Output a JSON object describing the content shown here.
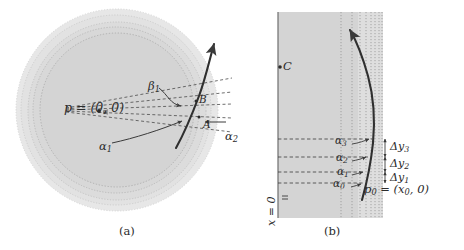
{
  "figure": {
    "panel_a": {
      "caption": "(a)",
      "center_point_label": "p = (0, 0)",
      "point_a_label": "A",
      "point_b_label": "B",
      "alpha1_label": "α",
      "alpha1_sub": "1",
      "alpha2_label": "α",
      "alpha2_sub": "2",
      "beta1_label": "β",
      "beta1_sub": "1"
    },
    "panel_b": {
      "caption": "(b)",
      "point_c_label": "C",
      "axis_label": "x = 0",
      "p0_label": "p",
      "p0_sub": "0",
      "p0_value": " = (x",
      "p0_value_sub": "0",
      "p0_value_end": ", 0)",
      "alphas": [
        {
          "label": "α",
          "sub": "0"
        },
        {
          "label": "α",
          "sub": "1"
        },
        {
          "label": "α",
          "sub": "2"
        },
        {
          "label": "α",
          "sub": "3"
        }
      ],
      "deltas": [
        {
          "label": "Δy",
          "sub": "1"
        },
        {
          "label": "Δy",
          "sub": "2"
        },
        {
          "label": "Δy",
          "sub": "3"
        }
      ]
    },
    "colors": {
      "fill_gray": "#d4d4d4",
      "fill_gray_light": "#dedede",
      "stroke_dark": "#3a3a3a",
      "stroke_mid": "#6e6e6e",
      "text": "#2b2b2b"
    }
  }
}
